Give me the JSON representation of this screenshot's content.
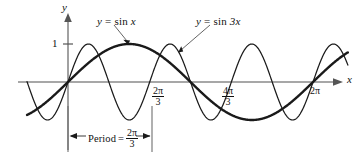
{
  "figure": {
    "title": "",
    "background_color": "#ffffff",
    "axis_color": "#8a8a8a",
    "curve_color": "#1a1a1a"
  },
  "axes": {
    "x_label": "x",
    "y_label": "y",
    "y_tick_label": "1",
    "x_tick_labels": [
      {
        "name": "two-pi-over-three",
        "numerator": "2π",
        "denominator": "3"
      },
      {
        "name": "four-pi-over-three",
        "numerator": "4π",
        "denominator": "3"
      },
      {
        "name": "two-pi",
        "text": "2π"
      }
    ]
  },
  "annotations": {
    "curve_label_sin_x": {
      "lhs": "y",
      "eq": "=",
      "fn": "sin",
      "arg": "x"
    },
    "curve_label_sin_3x": {
      "lhs": "y",
      "eq": "=",
      "fn": "sin",
      "arg": "3x"
    },
    "period": {
      "word": "Period",
      "eq": "=",
      "numerator": "2π",
      "denominator": "3"
    }
  },
  "chart_data": {
    "type": "line",
    "title": "",
    "xlabel": "x",
    "ylabel": "y",
    "grid": false,
    "legend": "inline-annotations",
    "xlim": [
      -1.05,
      7.25
    ],
    "ylim": [
      -1.45,
      1.45
    ],
    "xticks": [
      2.0943951,
      4.1887902,
      6.2831853
    ],
    "xticklabels": [
      "2π/3",
      "4π/3",
      "2π"
    ],
    "yticks": [
      1
    ],
    "yticklabels": [
      "1"
    ],
    "series": [
      {
        "name": "y = sin x",
        "expression": "sin(x)",
        "amplitude": 1,
        "period": 6.2831853,
        "stroke_width": 2.4,
        "color": "#1a1a1a",
        "x": [
          -1.05,
          -0.7854,
          0,
          0.7854,
          1.5708,
          2.3562,
          3.1416,
          3.927,
          4.7124,
          5.4978,
          6.2832,
          7.25
        ],
        "y": [
          -0.8674,
          -0.7071,
          0,
          0.7071,
          1,
          0.7071,
          0,
          -0.7071,
          -1,
          -0.7071,
          0,
          0.8415
        ]
      },
      {
        "name": "y = sin 3x",
        "expression": "sin(3x)",
        "amplitude": 1,
        "period": 2.0943951,
        "stroke_width": 1.25,
        "color": "#1a1a1a",
        "x": [
          -1.05,
          -0.7854,
          -0.5236,
          0,
          0.5236,
          1.0472,
          1.5708,
          2.0944,
          2.618,
          3.1416,
          3.6652,
          4.1888,
          4.7124,
          5.236,
          5.7596,
          6.2832,
          7.25
        ],
        "y": [
          0.0027,
          -0.7071,
          -1,
          0,
          1,
          0,
          -1,
          0,
          1,
          0,
          -1,
          0,
          1,
          0,
          -1,
          0,
          0.9093
        ]
      }
    ],
    "period_marker": {
      "label": "Period = 2π/3",
      "from_x": 0,
      "to_x": 2.0943951
    }
  }
}
